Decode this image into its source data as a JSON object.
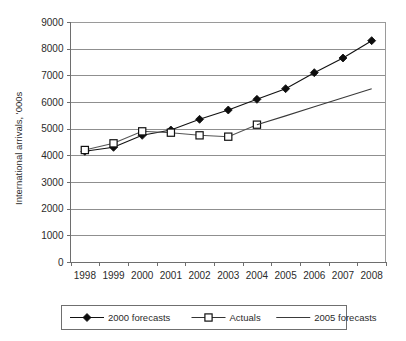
{
  "chart_data": {
    "type": "line",
    "title": "",
    "xlabel": "",
    "ylabel": "International arrivals, '000s",
    "categories": [
      "1998",
      "1999",
      "2000",
      "2001",
      "2002",
      "2003",
      "2004",
      "2005",
      "2006",
      "2007",
      "2008"
    ],
    "ylim": [
      0,
      9000
    ],
    "ytick_labels": [
      "0",
      "1000",
      "2000",
      "3000",
      "4000",
      "5000",
      "6000",
      "7000",
      "8000",
      "9000"
    ],
    "ytick_values": [
      0,
      1000,
      2000,
      3000,
      4000,
      5000,
      6000,
      7000,
      8000,
      9000
    ],
    "grid": "horizontal",
    "legend_position": "bottom",
    "series": [
      {
        "name": "2000 forecasts",
        "marker": "filled-diamond",
        "x": [
          "1998",
          "1999",
          "2000",
          "2001",
          "2002",
          "2003",
          "2004",
          "2005",
          "2006",
          "2007",
          "2008"
        ],
        "values": [
          4150,
          4300,
          4750,
          4950,
          5350,
          5700,
          6100,
          6500,
          7100,
          7650,
          8300
        ]
      },
      {
        "name": "Actuals",
        "marker": "open-square",
        "x": [
          "1998",
          "1999",
          "2000",
          "2001",
          "2002",
          "2003",
          "2004"
        ],
        "values": [
          4200,
          4450,
          4900,
          4850,
          4750,
          4700,
          5150
        ]
      },
      {
        "name": "2005 forecasts",
        "marker": "none",
        "x": [
          "2004",
          "2005",
          "2006",
          "2007",
          "2008"
        ],
        "values": [
          5150,
          5480,
          5820,
          6160,
          6500
        ]
      }
    ]
  },
  "axis": {
    "y_title": "International arrivals, '000s",
    "y_labels": [
      "9000",
      "8000",
      "7000",
      "6000",
      "5000",
      "4000",
      "3000",
      "2000",
      "1000",
      "0"
    ],
    "x_labels": [
      "1998",
      "1999",
      "2000",
      "2001",
      "2002",
      "2003",
      "2004",
      "2005",
      "2006",
      "2007",
      "2008"
    ]
  },
  "legend": {
    "items": [
      {
        "label": "2000 forecasts",
        "marker": "filled-diamond"
      },
      {
        "label": "Actuals",
        "marker": "open-square"
      },
      {
        "label": "2005 forecasts",
        "marker": "plain-line"
      }
    ]
  },
  "colors": {
    "series_2000_forecasts": "#0d0d0d",
    "series_actuals": "#111111",
    "series_2005_forecasts": "#3a3a3a",
    "gridline": "#8f8f8f",
    "background": "#ffffff"
  }
}
